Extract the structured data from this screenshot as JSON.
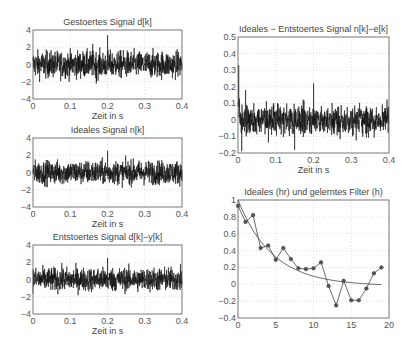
{
  "chart_data": [
    {
      "id": "p1",
      "type": "line",
      "title": "Gestoertes Signal d[k]",
      "xlabel": "Zeit in s",
      "ylabel": "",
      "xlim": [
        0,
        0.4
      ],
      "ylim": [
        -4,
        4
      ],
      "xticks": [
        "0",
        "0.1",
        "0.2",
        "0.3",
        "0.4"
      ],
      "yticks": [
        "4",
        "2",
        "0",
        "-2",
        "-4"
      ],
      "grid": true,
      "series": [
        {
          "name": "d[k]",
          "kind": "noise",
          "amplitude": 1.7,
          "peaks": [
            [
              0.16,
              2.4
            ],
            [
              0.2,
              3.4
            ],
            [
              0.17,
              -2.2
            ]
          ],
          "color": "#111111"
        }
      ],
      "box": {
        "left": 33,
        "top": 30,
        "width": 149,
        "height": 69
      }
    },
    {
      "id": "p2",
      "type": "line",
      "title": "Ideales Signal n[k]",
      "xlabel": "Zeit in s",
      "ylabel": "",
      "xlim": [
        0,
        0.4
      ],
      "ylim": [
        -4,
        4
      ],
      "xticks": [
        "0",
        "0.1",
        "0.2",
        "0.3",
        "0.4"
      ],
      "yticks": [
        "4",
        "2",
        "0",
        "-2",
        "-4"
      ],
      "grid": true,
      "series": [
        {
          "name": "n[k]",
          "kind": "noise",
          "amplitude": 1.5,
          "peaks": [
            [
              0.2,
              2.5
            ]
          ],
          "color": "#111111"
        }
      ],
      "box": {
        "left": 33,
        "top": 138,
        "width": 149,
        "height": 69
      }
    },
    {
      "id": "p3",
      "type": "line",
      "title": "Entstoertes Signal d[k]−y[k]",
      "xlabel": "Zeit in s",
      "ylabel": "",
      "xlim": [
        0,
        0.4
      ],
      "ylim": [
        -4,
        4
      ],
      "xticks": [
        "0",
        "0.1",
        "0.2",
        "0.3",
        "0.4"
      ],
      "yticks": [
        "4",
        "2",
        "0",
        "-2",
        "-4"
      ],
      "grid": true,
      "series": [
        {
          "name": "d[k]-y[k]",
          "kind": "noise",
          "amplitude": 1.5,
          "peaks": [
            [
              0.2,
              2.5
            ]
          ],
          "color": "#111111"
        }
      ],
      "box": {
        "left": 33,
        "top": 245,
        "width": 149,
        "height": 69
      }
    },
    {
      "id": "p4",
      "type": "line",
      "title": "Ideales − Entstoertes Signal n[k]−e[k]",
      "xlabel": "Zeit in s",
      "ylabel": "",
      "xlim": [
        0,
        0.4
      ],
      "ylim": [
        -0.2,
        0.5
      ],
      "xticks": [
        "0",
        "0.1",
        "0.2",
        "0.3",
        "0.4"
      ],
      "yticks": [
        "0.5",
        "0.4",
        "0.3",
        "0.2",
        "0.1",
        "0",
        "-0.1",
        "-0.2"
      ],
      "grid": true,
      "series": [
        {
          "name": "n[k]-e[k]",
          "kind": "noise",
          "amplitude": 0.09,
          "peaks": [
            [
              0.002,
              0.33
            ],
            [
              0.02,
              0.18
            ],
            [
              0.2,
              0.22
            ],
            [
              0.15,
              -0.18
            ],
            [
              0.01,
              -0.19
            ]
          ],
          "color": "#111111"
        }
      ],
      "box": {
        "left": 238,
        "top": 37,
        "width": 151,
        "height": 116
      }
    },
    {
      "id": "p5",
      "type": "line",
      "title": "Ideales (hr) und gelerntes Filter (h)",
      "xlabel": "",
      "ylabel": "",
      "xlim": [
        0,
        20
      ],
      "ylim": [
        -0.4,
        1
      ],
      "xticks": [
        "0",
        "5",
        "10",
        "15",
        "20"
      ],
      "yticks": [
        "1",
        "0.8",
        "0.6",
        "0.4",
        "0.2",
        "0",
        "-0.2",
        "-0.4"
      ],
      "grid": true,
      "series": [
        {
          "name": "hr (ideal)",
          "kind": "curve",
          "x": [
            0,
            1,
            2,
            3,
            4,
            5,
            6,
            7,
            8,
            9,
            10,
            11,
            12,
            13,
            14,
            15,
            16,
            17,
            18,
            19
          ],
          "values": [
            0.98,
            0.78,
            0.62,
            0.5,
            0.41,
            0.33,
            0.27,
            0.22,
            0.18,
            0.15,
            0.12,
            0.1,
            0.08,
            0.06,
            0.05,
            0.04,
            0.03,
            0.02,
            0.01,
            -0.01
          ],
          "color": "#444444",
          "marker": "none"
        },
        {
          "name": "h (gelernt)",
          "kind": "curve",
          "x": [
            0,
            1,
            2,
            3,
            4,
            5,
            6,
            7,
            8,
            9,
            10,
            11,
            12,
            13,
            14,
            15,
            16,
            17,
            18,
            19
          ],
          "values": [
            0.93,
            0.74,
            0.82,
            0.43,
            0.46,
            0.29,
            0.43,
            0.3,
            0.19,
            0.18,
            0.19,
            0.26,
            -0.02,
            -0.25,
            0.04,
            -0.19,
            -0.19,
            -0.05,
            0.13,
            0.2
          ],
          "color": "#444444",
          "marker": "*"
        }
      ],
      "box": {
        "left": 238,
        "top": 200,
        "width": 151,
        "height": 118
      }
    }
  ],
  "labels": {
    "p1": {
      "title": "Gestoertes Signal d[k]",
      "xlabel": "Zeit in s"
    },
    "p2": {
      "title": "Ideales Signal n[k]",
      "xlabel": "Zeit in s"
    },
    "p3": {
      "title": "Entstoertes Signal d[k]−y[k]",
      "xlabel": "Zeit in s"
    },
    "p4": {
      "title": "Ideales − Entstoertes Signal n[k]−e[k]",
      "xlabel": "Zeit in s"
    },
    "p5": {
      "title": "Ideales (hr) und gelerntes Filter (h)"
    }
  }
}
